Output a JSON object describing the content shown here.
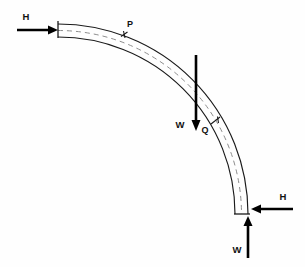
{
  "figure": {
    "background_color": "#fefefe",
    "line_color": "#1a1a1a",
    "centerline_color": "#8d8d8d",
    "force_color": "#000000"
  },
  "labels": {
    "force_h_top": "H",
    "point_p": "P",
    "force_w_middle": "W",
    "point_q": "Q",
    "force_h_bottom": "H",
    "force_w_bottom": "W"
  },
  "geometry": {
    "arc_center_x": 58,
    "arc_center_y": 214,
    "outer_radius": 190,
    "inner_radius": 177,
    "mid_radius": 183.5,
    "start_angle_deg": 90,
    "end_angle_deg": 0,
    "beam_thickness": 13,
    "fixed_end_x": 58,
    "fixed_end_y_top": 21,
    "fixed_end_y_bottom": 34,
    "free_end_y": 214,
    "free_end_x_left": 242,
    "free_end_x_right": 254
  },
  "forces": [
    {
      "name": "H-top",
      "label": "H",
      "direction": "right",
      "x_start": 17,
      "x_end": 58,
      "y": 30,
      "label_x": 26,
      "label_y": 20
    },
    {
      "name": "W-middle",
      "label": "W",
      "direction": "down",
      "x": 196,
      "y_start": 55,
      "y_end": 130,
      "label_x": 180,
      "label_y": 128
    },
    {
      "name": "H-bottom",
      "label": "H",
      "direction": "left",
      "x_start": 293,
      "x_end": 253,
      "y": 209,
      "label_x": 283,
      "label_y": 200
    },
    {
      "name": "W-bottom",
      "label": "W",
      "direction": "up",
      "x": 248,
      "y_start": 258,
      "y_end": 217,
      "label_x": 237,
      "label_y": 253
    }
  ],
  "points": [
    {
      "name": "P",
      "label": "P",
      "tick_type": "cross",
      "tick_x": 124,
      "tick_y": 35,
      "label_x": 128,
      "label_y": 27
    },
    {
      "name": "Q",
      "label": "Q",
      "tick_type": "slash",
      "tick_x": 216,
      "tick_y": 121,
      "label_x": 202,
      "label_y": 133
    }
  ]
}
